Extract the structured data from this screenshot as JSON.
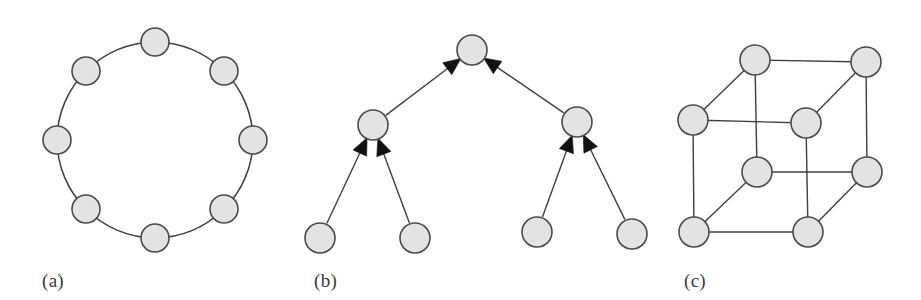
{
  "figure": {
    "background_color": "#ffffff",
    "node_fill": "#e3e3e3",
    "node_stroke": "#4a4a4a",
    "edge_color": "#3f3f3f",
    "arrow_color": "#121212"
  },
  "panels": [
    {
      "id": "a",
      "caption": "(a)",
      "topology": "ring",
      "node_count": 8,
      "directed": false,
      "edge_count": 8,
      "geometry": {
        "center_x": 155,
        "center_y": 140,
        "radius": 98,
        "node_radius": 14,
        "start_angle_deg": -90
      },
      "nodes": [
        {
          "index": 0,
          "x": 155,
          "y": 42
        },
        {
          "index": 1,
          "x": 224,
          "y": 71
        },
        {
          "index": 2,
          "x": 253,
          "y": 140
        },
        {
          "index": 3,
          "x": 224,
          "y": 209
        },
        {
          "index": 4,
          "x": 155,
          "y": 238
        },
        {
          "index": 5,
          "x": 86,
          "y": 209
        },
        {
          "index": 6,
          "x": 57,
          "y": 140
        },
        {
          "index": 7,
          "x": 86,
          "y": 71
        }
      ],
      "edges": [
        [
          0,
          1
        ],
        [
          1,
          2
        ],
        [
          2,
          3
        ],
        [
          3,
          4
        ],
        [
          4,
          5
        ],
        [
          5,
          6
        ],
        [
          6,
          7
        ],
        [
          7,
          0
        ]
      ]
    },
    {
      "id": "b",
      "caption": "(b)",
      "topology": "binary-tree",
      "node_count": 7,
      "directed": true,
      "edge_count": 6,
      "arrow_direction": "child-to-parent",
      "levels": 3,
      "node_radius": 15,
      "nodes": [
        {
          "index": 0,
          "role": "root",
          "x": 472,
          "y": 50
        },
        {
          "index": 1,
          "role": "internal",
          "x": 373,
          "y": 125
        },
        {
          "index": 2,
          "role": "internal",
          "x": 577,
          "y": 122
        },
        {
          "index": 3,
          "role": "leaf",
          "x": 320,
          "y": 238
        },
        {
          "index": 4,
          "role": "leaf",
          "x": 415,
          "y": 238
        },
        {
          "index": 5,
          "role": "leaf",
          "x": 537,
          "y": 232
        },
        {
          "index": 6,
          "role": "leaf",
          "x": 632,
          "y": 234
        }
      ],
      "edges": [
        {
          "from": 1,
          "to": 0
        },
        {
          "from": 2,
          "to": 0
        },
        {
          "from": 3,
          "to": 1
        },
        {
          "from": 4,
          "to": 1
        },
        {
          "from": 5,
          "to": 2
        },
        {
          "from": 6,
          "to": 2
        }
      ]
    },
    {
      "id": "c",
      "caption": "(c)",
      "topology": "hypercube-cube",
      "node_count": 8,
      "directed": false,
      "edge_count": 12,
      "node_radius": 15,
      "nodes": [
        {
          "index": 0,
          "label": "back-top-left",
          "x": 755,
          "y": 60
        },
        {
          "index": 1,
          "label": "back-top-right",
          "x": 866,
          "y": 62
        },
        {
          "index": 2,
          "label": "front-top-left",
          "x": 693,
          "y": 120
        },
        {
          "index": 3,
          "label": "front-top-right",
          "x": 806,
          "y": 123
        },
        {
          "index": 4,
          "label": "front-bottom-left",
          "x": 757,
          "y": 172
        },
        {
          "index": 5,
          "label": "back-bottom-right",
          "x": 867,
          "y": 172
        },
        {
          "index": 6,
          "label": "bottom-left",
          "x": 694,
          "y": 232
        },
        {
          "index": 7,
          "label": "bottom-right",
          "x": 808,
          "y": 232
        }
      ],
      "edges": [
        [
          0,
          1
        ],
        [
          0,
          2
        ],
        [
          0,
          4
        ],
        [
          1,
          3
        ],
        [
          1,
          5
        ],
        [
          2,
          3
        ],
        [
          2,
          6
        ],
        [
          3,
          7
        ],
        [
          4,
          5
        ],
        [
          4,
          6
        ],
        [
          5,
          7
        ],
        [
          6,
          7
        ]
      ]
    }
  ]
}
